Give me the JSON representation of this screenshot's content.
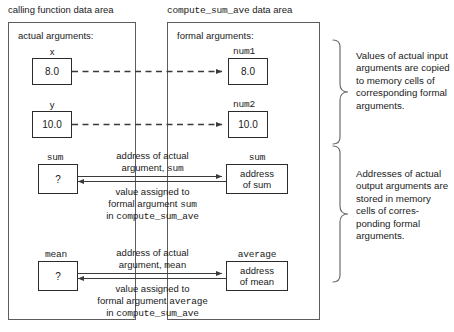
{
  "headers": {
    "left": "calling function data area",
    "right_mono": "compute_sum_ave",
    "right_tail": " data area"
  },
  "left_panel": {
    "title": "actual arguments:",
    "cells": [
      {
        "label": "x",
        "value": "8.0"
      },
      {
        "label": "y",
        "value": "10.0"
      },
      {
        "label": "sum",
        "value": "?"
      },
      {
        "label": "mean",
        "value": "?"
      }
    ]
  },
  "right_panel": {
    "title": "formal arguments:",
    "cells": [
      {
        "label": "num1",
        "value": "8.0"
      },
      {
        "label": "num2",
        "value": "10.0"
      },
      {
        "label": "sum",
        "value_line1": "address",
        "value_line2": "of sum"
      },
      {
        "label": "average",
        "value_line1": "address",
        "value_line2": "of mean"
      }
    ]
  },
  "annotations": {
    "sum": {
      "above_line1": "address of actual",
      "above_line2_pre": "argument, ",
      "above_line2_mono": "sum",
      "below_line1": "value assigned to",
      "below_line2_pre": "formal argument ",
      "below_line2_mono": "sum",
      "below_line3_pre": "in ",
      "below_line3_mono": "compute_sum_ave"
    },
    "mean": {
      "above_line1": "address of actual",
      "above_line2_pre": "argument, ",
      "above_line2_mono": "mean",
      "below_line1": "value assigned to",
      "below_line2_pre": "formal argument ",
      "below_line2_mono": "average",
      "below_line3_pre": "in ",
      "below_line3_mono": "compute_sum_ave"
    }
  },
  "descriptions": {
    "top": "Values of actual input arguments are copied to memory cells of corresponding formal arguments.",
    "bottom": "Addresses of actual output arguments are stored in memory cells of corres-ponding formal arguments."
  },
  "colors": {
    "ink": "#1a1a1a",
    "panel_border": "#5d5d5d",
    "cell_border": "#2b2b2b",
    "arrow": "#3a3a3a",
    "brace": "#6e6e6e"
  }
}
